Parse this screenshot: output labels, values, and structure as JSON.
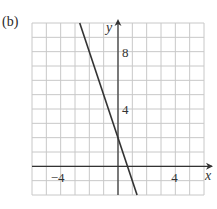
{
  "panel_label": "(b)",
  "chart_data": {
    "type": "line",
    "title": "",
    "panel": "(b)",
    "xlabel": "x",
    "ylabel": "y",
    "xlim": [
      -6,
      6
    ],
    "ylim": [
      -2,
      10
    ],
    "grid": true,
    "grid_step": 1,
    "x_ticks_labeled": [
      -4,
      4
    ],
    "y_ticks_labeled": [
      4,
      8
    ],
    "series": [
      {
        "name": "line",
        "equation": "y = -3x + 2",
        "slope": -3,
        "intercept": 2,
        "x": [
          -2.67,
          1.33
        ],
        "y": [
          10,
          -2
        ]
      }
    ],
    "legend": null
  },
  "ticks": {
    "x_neg4": "−4",
    "x_4": "4",
    "y_4": "4",
    "y_8": "8"
  },
  "axes": {
    "x": "x",
    "y": "y"
  }
}
